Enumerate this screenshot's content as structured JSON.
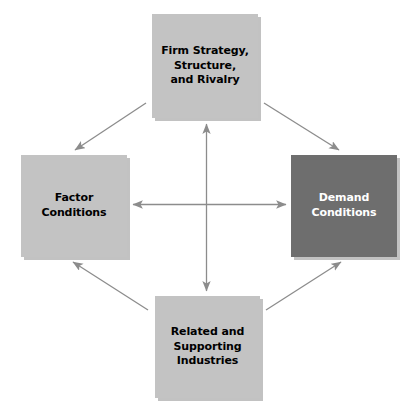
{
  "diagram": {
    "type": "diamond-framework",
    "colors": {
      "box_light": "#c3c3c3",
      "box_dark": "#6e6e6e",
      "text_dark": "#000000",
      "text_light": "#ffffff",
      "connector": "#8c8c8c",
      "background": "#ffffff"
    },
    "nodes": [
      {
        "id": "firm-strategy",
        "label": "Firm Strategy,\nStructure,\nand Rivalry",
        "position": "top",
        "fill": "#c3c3c3",
        "text_color": "#000000"
      },
      {
        "id": "factor-conditions",
        "label": "Factor\nConditions",
        "position": "left",
        "fill": "#c3c3c3",
        "text_color": "#000000"
      },
      {
        "id": "demand-conditions",
        "label": "Demand\nConditions",
        "position": "right",
        "fill": "#6e6e6e",
        "text_color": "#ffffff"
      },
      {
        "id": "related-industries",
        "label": "Related and\nSupporting\nIndustries",
        "position": "bottom",
        "fill": "#c3c3c3",
        "text_color": "#000000"
      }
    ],
    "connectors": [
      {
        "id": "horizontal-axis",
        "from": "factor-conditions",
        "to": "demand-conditions",
        "style": "double-headed",
        "orientation": "horizontal"
      },
      {
        "id": "vertical-axis",
        "from": "related-industries",
        "to": "firm-strategy",
        "style": "double-headed",
        "orientation": "vertical"
      },
      {
        "id": "diagonal-top-left",
        "from": "firm-strategy",
        "to": "factor-conditions",
        "style": "single-headed",
        "orientation": "diagonal"
      },
      {
        "id": "diagonal-top-right",
        "from": "firm-strategy",
        "to": "demand-conditions",
        "style": "single-headed",
        "orientation": "diagonal"
      },
      {
        "id": "diagonal-bottom-left",
        "from": "related-industries",
        "to": "factor-conditions",
        "style": "single-headed",
        "orientation": "diagonal"
      },
      {
        "id": "diagonal-bottom-right",
        "from": "related-industries",
        "to": "demand-conditions",
        "style": "single-headed",
        "orientation": "diagonal"
      }
    ]
  }
}
